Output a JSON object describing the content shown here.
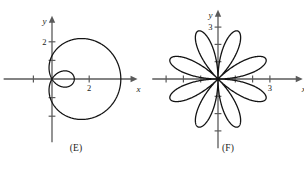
{
  "figure": {
    "background": "#ffffff",
    "curve_color": "#141414",
    "axis_color": "#5a5a5a",
    "panels": [
      {
        "id": "E",
        "caption": "(E)",
        "axes": {
          "x_label": "x",
          "y_label": "y",
          "x_ticks": [
            {
              "value": -1,
              "label": ""
            },
            {
              "value": 2,
              "label": "2"
            }
          ],
          "y_ticks": [
            {
              "value": 2,
              "label": "2"
            },
            {
              "value": 1,
              "label": ""
            },
            {
              "value": -1,
              "label": ""
            },
            {
              "value": -2,
              "label": ""
            }
          ],
          "origin_px": {
            "x": 52,
            "y": 79
          },
          "unit_px": 18.6,
          "x_range": [
            -2.6,
            4.6
          ],
          "y_range": [
            -3.4,
            3.4
          ]
        },
        "curve": {
          "type": "limacon-with-inner-loop",
          "equation": "r = 1.25 + 2.45 cos(theta)",
          "a": 1.25,
          "b": 2.45,
          "max_radius": 3.7,
          "inner_loop_extent": 1.2
        }
      },
      {
        "id": "F",
        "caption": "(F)",
        "axes": {
          "x_label": "x",
          "y_label": "y",
          "x_ticks": [
            {
              "value": -3,
              "label": ""
            },
            {
              "value": -2,
              "label": ""
            },
            {
              "value": -1,
              "label": ""
            },
            {
              "value": 1,
              "label": ""
            },
            {
              "value": 2,
              "label": ""
            },
            {
              "value": 3,
              "label": "3"
            }
          ],
          "y_ticks": [
            {
              "value": 3,
              "label": "3"
            },
            {
              "value": 2,
              "label": ""
            },
            {
              "value": 1,
              "label": ""
            },
            {
              "value": -1,
              "label": ""
            },
            {
              "value": -2,
              "label": ""
            },
            {
              "value": -3,
              "label": ""
            }
          ],
          "origin_px": {
            "x": 66,
            "y": 79
          },
          "unit_px": 17.3,
          "x_range": [
            -3.8,
            4.9
          ],
          "y_range": [
            -4.0,
            4.0
          ]
        },
        "curve": {
          "type": "rose",
          "equation": "r = 3 sin(4 theta)",
          "petals": 8,
          "petal_length": 3,
          "petal_rotation_deg": 22.5
        }
      }
    ]
  }
}
